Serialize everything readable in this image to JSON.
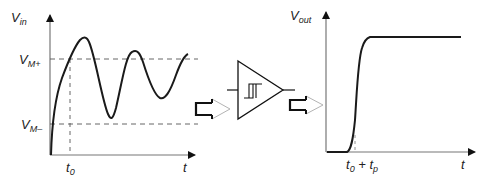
{
  "input_plot": {
    "y_label": {
      "main": "V",
      "sub": "in"
    },
    "x_label": "t",
    "threshold_high": {
      "main": "V",
      "sub": "M+"
    },
    "threshold_low": {
      "main": "V",
      "sub": "M–"
    },
    "time_marker": {
      "main": "t",
      "sub": "0"
    },
    "signal": "damped oscillation rising from 0, first crossing V_M+ at t0"
  },
  "comparator": {
    "symbol": "schmitt-trigger",
    "description": "comparator with hysteresis"
  },
  "output_plot": {
    "y_label": {
      "main": "V",
      "sub": "out"
    },
    "x_label": "t",
    "time_marker": {
      "main": "t",
      "sub0": "0",
      "plus": " + ",
      "main2": "t",
      "sub1": "p"
    },
    "signal": "step from low to high at t0 + tp"
  },
  "flow_arrows": [
    "input-to-comparator",
    "comparator-to-output"
  ],
  "colors": {
    "stroke": "#222222",
    "dash": "#555555",
    "arrow_outline": "#999999"
  }
}
